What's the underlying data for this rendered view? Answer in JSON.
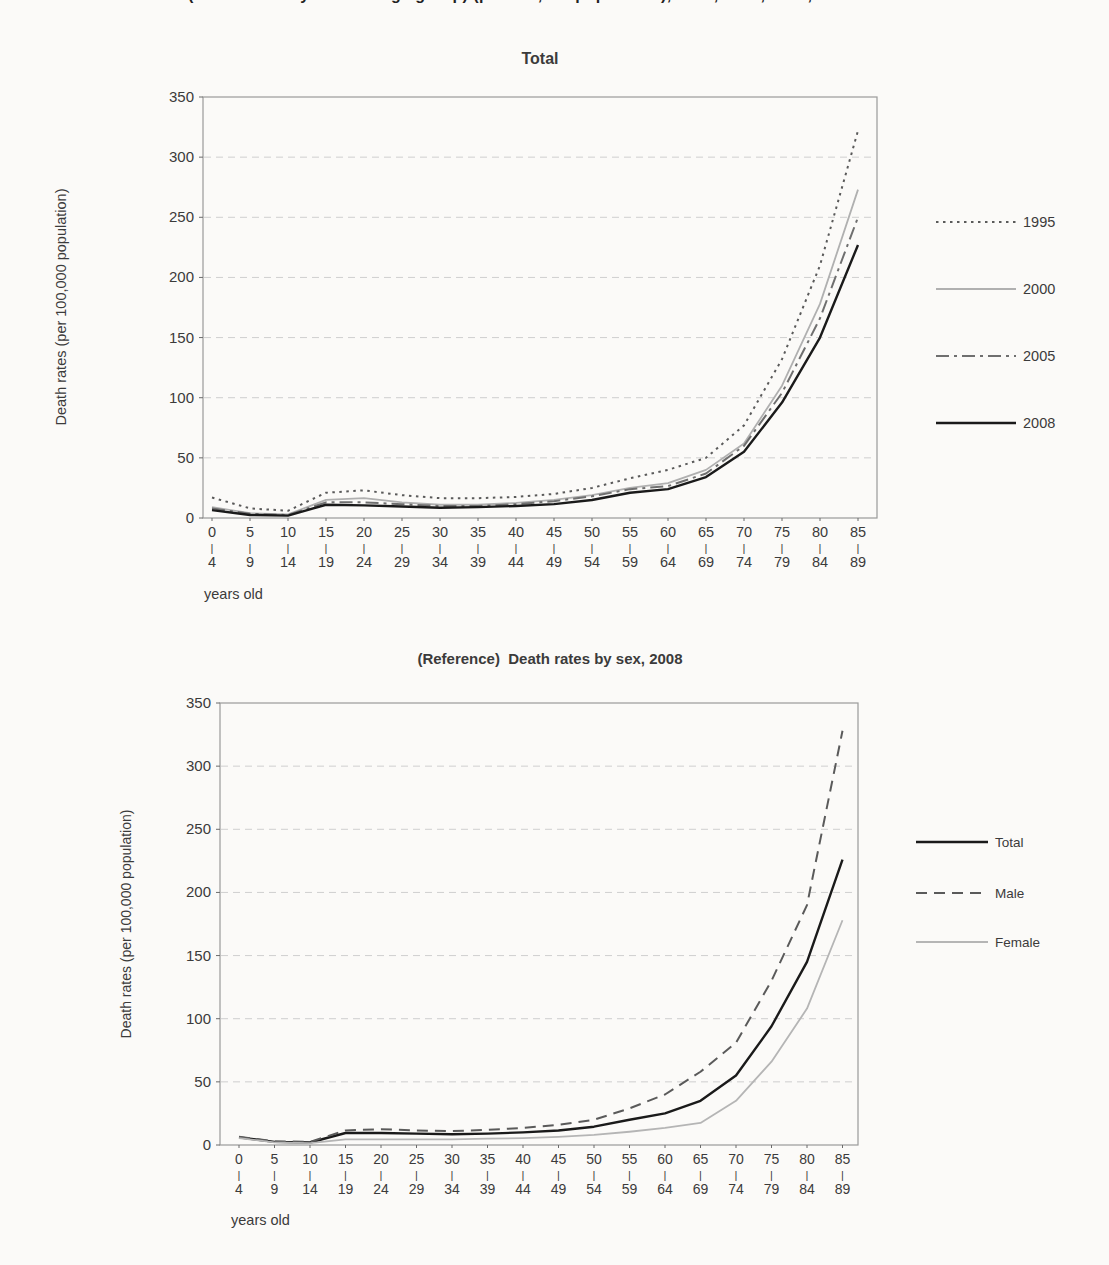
{
  "page": {
    "background": "#fbfaf8",
    "text_color": "#3b3b3b"
  },
  "cropped_title": {
    "fragment": "(Death rates by sex and age group) (per 100,000 population), 1995, 2000, 2005, 2008"
  },
  "axis": {
    "ylabel": "Death rates (per 100,000 population)",
    "xlabel": "years old",
    "tick_separator": "|"
  },
  "chart_data": [
    {
      "type": "line",
      "title": "Total",
      "ylabel": "Death rates (per 100,000 population)",
      "xlabel": "years old",
      "ylim": [
        0,
        350
      ],
      "ytick_step": 50,
      "grid": true,
      "legend_position": "right",
      "categories": [
        {
          "start": "0",
          "end": "4"
        },
        {
          "start": "5",
          "end": "9"
        },
        {
          "start": "10",
          "end": "14"
        },
        {
          "start": "15",
          "end": "19"
        },
        {
          "start": "20",
          "end": "24"
        },
        {
          "start": "25",
          "end": "29"
        },
        {
          "start": "30",
          "end": "34"
        },
        {
          "start": "35",
          "end": "39"
        },
        {
          "start": "40",
          "end": "44"
        },
        {
          "start": "45",
          "end": "49"
        },
        {
          "start": "50",
          "end": "54"
        },
        {
          "start": "55",
          "end": "59"
        },
        {
          "start": "60",
          "end": "64"
        },
        {
          "start": "65",
          "end": "69"
        },
        {
          "start": "70",
          "end": "74"
        },
        {
          "start": "75",
          "end": "79"
        },
        {
          "start": "80",
          "end": "84"
        },
        {
          "start": "85",
          "end": "89"
        }
      ],
      "series": [
        {
          "name": "1995",
          "color": "#5a5a5a",
          "style": "dotted",
          "values": [
            17,
            8,
            6,
            21,
            23,
            19,
            16.5,
            16.5,
            17.5,
            20,
            25,
            33,
            40,
            50,
            77,
            132,
            210,
            322
          ]
        },
        {
          "name": "2000",
          "color": "#b0b0b0",
          "style": "solid",
          "values": [
            9,
            4,
            3,
            15,
            16.5,
            13,
            11,
            11,
            12.5,
            15,
            19,
            25,
            29,
            40,
            62,
            110,
            178,
            273
          ]
        },
        {
          "name": "2005",
          "color": "#6f6f6f",
          "style": "dash-dot",
          "values": [
            8,
            3.5,
            2.5,
            13,
            13,
            11.5,
            10,
            10,
            11.5,
            14,
            18,
            24,
            26.5,
            37,
            60,
            104,
            166,
            250
          ]
        },
        {
          "name": "2008",
          "color": "#1a1a1a",
          "style": "solid",
          "values": [
            6.5,
            2.5,
            2,
            11,
            10.5,
            9.5,
            8.5,
            9,
            10,
            11.5,
            15,
            21,
            24,
            34,
            55,
            96,
            150,
            227
          ]
        }
      ]
    },
    {
      "type": "line",
      "title": "(Reference)  Death rates by sex, 2008",
      "ylabel": "Death rates (per 100,000 population)",
      "xlabel": "years old",
      "ylim": [
        0,
        350
      ],
      "ytick_step": 50,
      "grid": true,
      "legend_position": "right",
      "categories": [
        {
          "start": "0",
          "end": "4"
        },
        {
          "start": "5",
          "end": "9"
        },
        {
          "start": "10",
          "end": "14"
        },
        {
          "start": "15",
          "end": "19"
        },
        {
          "start": "20",
          "end": "24"
        },
        {
          "start": "25",
          "end": "29"
        },
        {
          "start": "30",
          "end": "34"
        },
        {
          "start": "35",
          "end": "39"
        },
        {
          "start": "40",
          "end": "44"
        },
        {
          "start": "45",
          "end": "49"
        },
        {
          "start": "50",
          "end": "54"
        },
        {
          "start": "55",
          "end": "59"
        },
        {
          "start": "60",
          "end": "64"
        },
        {
          "start": "65",
          "end": "69"
        },
        {
          "start": "70",
          "end": "74"
        },
        {
          "start": "75",
          "end": "79"
        },
        {
          "start": "80",
          "end": "84"
        },
        {
          "start": "85",
          "end": "89"
        }
      ],
      "series": [
        {
          "name": "Total",
          "color": "#1a1a1a",
          "style": "solid",
          "values": [
            6,
            2.5,
            2,
            9.5,
            9.5,
            9,
            8.5,
            9,
            10,
            11.5,
            14.5,
            20,
            25,
            35,
            55,
            94,
            145,
            226
          ]
        },
        {
          "name": "Male",
          "color": "#5a5a5a",
          "style": "dashed",
          "values": [
            6.5,
            3,
            2.5,
            11.5,
            12.5,
            11.5,
            11,
            12,
            13.5,
            16,
            20,
            29,
            40,
            58,
            81,
            130,
            190,
            328
          ]
        },
        {
          "name": "Female",
          "color": "#b5b5b5",
          "style": "solid",
          "values": [
            5.5,
            2,
            1.5,
            4.5,
            4.5,
            4.5,
            4.5,
            5,
            5.5,
            6.5,
            8,
            10.5,
            13.5,
            17.5,
            35,
            66,
            108,
            178
          ]
        }
      ]
    }
  ]
}
